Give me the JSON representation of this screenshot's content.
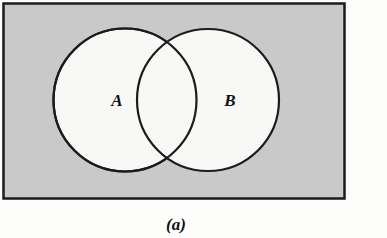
{
  "figure": {
    "caption": "(a)",
    "caption_label": "(a)",
    "diagram_type": "venn-diagram",
    "set_count": 2
  },
  "universe": {
    "name": "universal-set-rectangle",
    "fill_color": "#c9c9c9",
    "stroke_color": "#1b1b1b",
    "stroke_width": 2.5,
    "x": 3.5,
    "y": 3.5,
    "width": 341,
    "height": 195
  },
  "sets": [
    {
      "id": "set-a",
      "label": "A",
      "cx": 125,
      "cy": 100,
      "r": 71.5,
      "fill_color": "#f8f8f6",
      "stroke_color": "#1b1b1b",
      "stroke_width": 2.2,
      "label_x": 117,
      "label_y": 102
    },
    {
      "id": "set-b",
      "label": "B",
      "cx": 208,
      "cy": 100,
      "r": 71.0,
      "fill_color": "#f8f8f6",
      "stroke_color": "#1b1b1b",
      "stroke_width": 2.2,
      "label_x": 230,
      "label_y": 102
    }
  ],
  "intersection": {
    "name": "a-intersect-b-lens",
    "top_point_x": 173,
    "top_point_y": 48,
    "bottom_point_x": 173,
    "bottom_point_y": 153,
    "fill_color": "#f8f8f6"
  },
  "caption_position": {
    "x": 176,
    "y": 226
  },
  "canvas": {
    "width": 387,
    "height": 238,
    "background_color": "#fdfdfc"
  }
}
